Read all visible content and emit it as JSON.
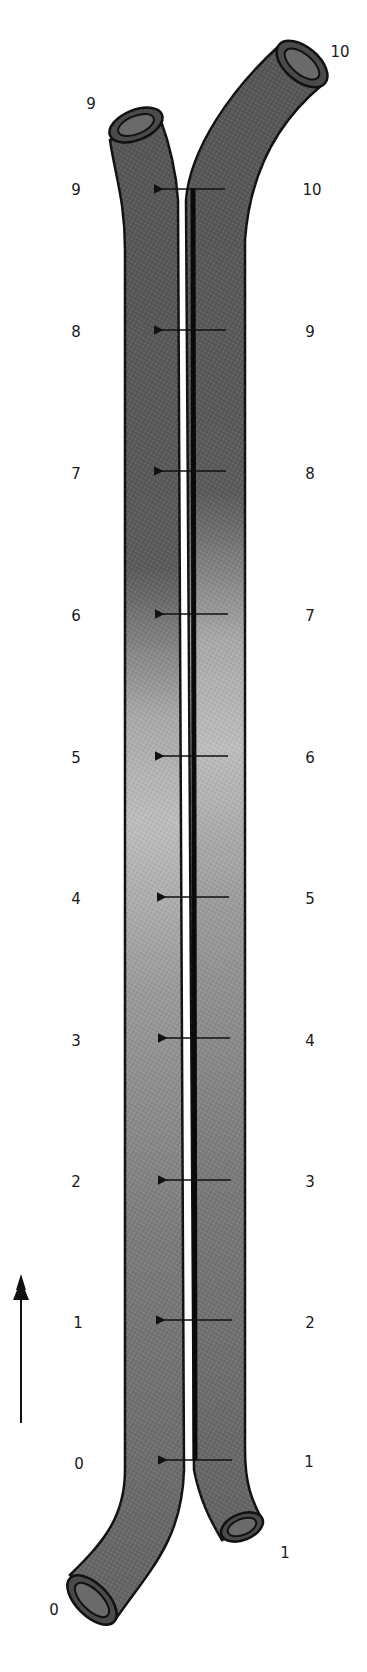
{
  "diagram": {
    "type": "countercurrent-exchange-tubes",
    "left_tube": {
      "end_labels": {
        "inlet_bottom": "0",
        "outlet_top": "9"
      },
      "scale_labels": [
        "0",
        "1",
        "2",
        "3",
        "4",
        "5",
        "6",
        "7",
        "8",
        "9"
      ]
    },
    "right_tube": {
      "end_labels": {
        "outlet_bottom": "1",
        "inlet_top": "10"
      },
      "scale_labels": [
        "1",
        "2",
        "3",
        "4",
        "5",
        "6",
        "7",
        "8",
        "9",
        "10"
      ]
    },
    "transfer_arrows": 10,
    "flow_direction_arrow": "up",
    "colors": {
      "tube_dark": "#555555",
      "tube_light": "#b8b8b8",
      "outline": "#111111",
      "divider": "#0a0a0a"
    }
  },
  "labels": {
    "left_top_end": "9",
    "right_top_end": "10",
    "left_bottom_end": "0",
    "right_bottom_end": "1",
    "left": {
      "l0": "0",
      "l1": "1",
      "l2": "2",
      "l3": "3",
      "l4": "4",
      "l5": "5",
      "l6": "6",
      "l7": "7",
      "l8": "8",
      "l9": "9"
    },
    "right": {
      "r1": "1",
      "r2": "2",
      "r3": "3",
      "r4": "4",
      "r5": "5",
      "r6": "6",
      "r7": "7",
      "r8": "8",
      "r9": "9",
      "r10": "10"
    }
  }
}
